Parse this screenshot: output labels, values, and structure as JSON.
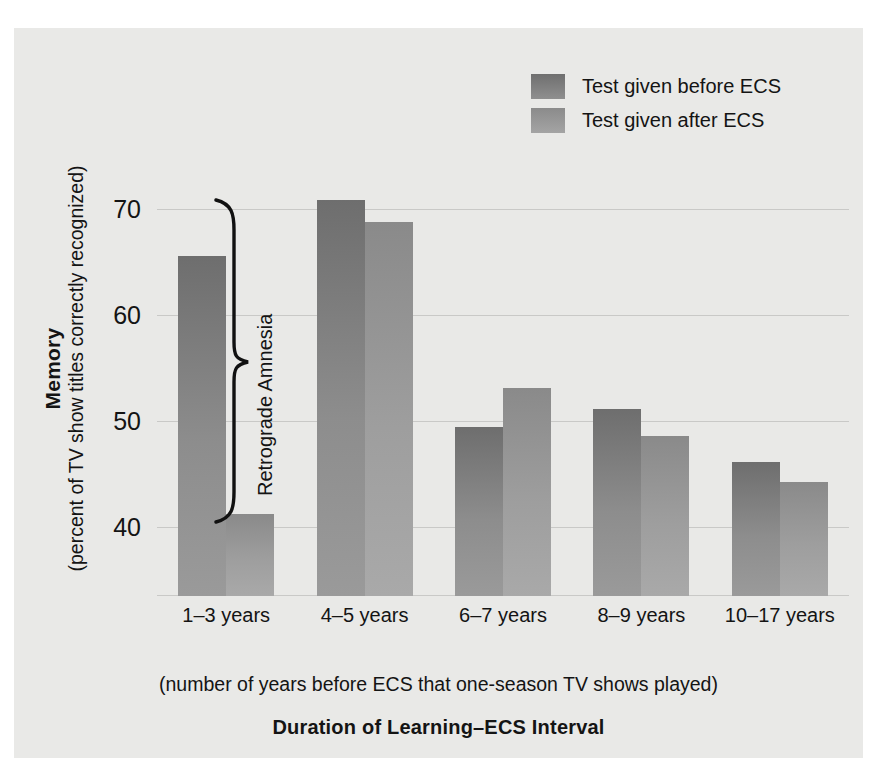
{
  "chart_data": {
    "type": "bar",
    "title": "",
    "xlabel": "Duration of Learning–ECS Interval",
    "xlabel_sub": "(number of years before ECS that one-season TV shows played)",
    "ylabel": "Memory",
    "ylabel_sub": "(percent of TV show titles correctly recognized)",
    "categories": [
      "1–3 years",
      "4–5 years",
      "6–7 years",
      "8–9 years",
      "10–17 years"
    ],
    "series": [
      {
        "name": "Test given before ECS",
        "color": "#7d7d7d",
        "values": [
          65.6,
          70.9,
          49.4,
          51.1,
          46.1
        ]
      },
      {
        "name": "Test given after ECS",
        "color": "#9b9b9b",
        "values": [
          41.2,
          68.8,
          53.1,
          48.6,
          44.3
        ]
      }
    ],
    "yticks": [
      40,
      50,
      60,
      70
    ],
    "ylim": [
      33.5,
      85
    ],
    "grid": true,
    "legend_position": "top-right",
    "annotations": [
      {
        "text": "Retrograde Amnesia",
        "type": "brace",
        "group": "1–3 years"
      }
    ]
  },
  "legend": {
    "items": [
      {
        "label": "Test given before ECS",
        "swatch": "before"
      },
      {
        "label": "Test given after ECS",
        "swatch": "after"
      }
    ]
  },
  "colors": {
    "panel_background": "#e9e9e7",
    "gridline": "#c9c9c7",
    "text": "#141414",
    "bar_before": "#7d7d7d",
    "bar_after": "#9b9b9b"
  }
}
